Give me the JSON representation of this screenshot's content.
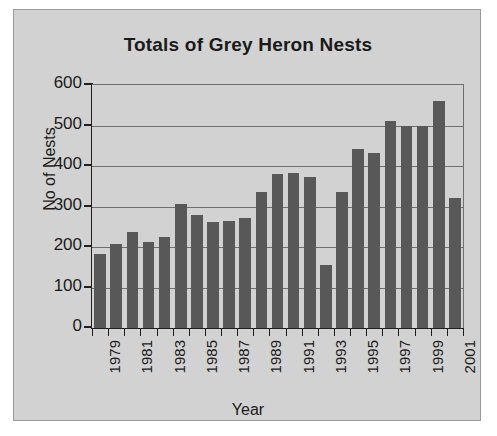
{
  "chart_data": {
    "type": "bar",
    "title": "Totals of Grey Heron Nests",
    "xlabel": "Year",
    "ylabel": "No of Nests",
    "categories": [
      "1979",
      "1980",
      "1981",
      "1982",
      "1983",
      "1984",
      "1985",
      "1986",
      "1987",
      "1988",
      "1989",
      "1990",
      "1991",
      "1992",
      "1993",
      "1994",
      "1995",
      "1996",
      "1997",
      "1998",
      "1999",
      "2000",
      "2001"
    ],
    "values": [
      183,
      207,
      237,
      212,
      224,
      307,
      280,
      263,
      265,
      271,
      335,
      381,
      383,
      374,
      156,
      337,
      441,
      431,
      510,
      499,
      500,
      560,
      322
    ],
    "tick_labels_x": [
      "1979",
      "1981",
      "1983",
      "1985",
      "1987",
      "1989",
      "1991",
      "1993",
      "1995",
      "1997",
      "1999",
      "2001"
    ],
    "tick_labels_y": [
      "0",
      "100",
      "200",
      "300",
      "400",
      "500",
      "600"
    ],
    "ylim": [
      0,
      600
    ],
    "y_tick_interval": 100,
    "grid": true,
    "legend": false,
    "bar_color": "#585858",
    "plot_background": "#d2d2d2",
    "axis_color": "#1f1f1f",
    "gridline_color": "#6e6e6e"
  }
}
